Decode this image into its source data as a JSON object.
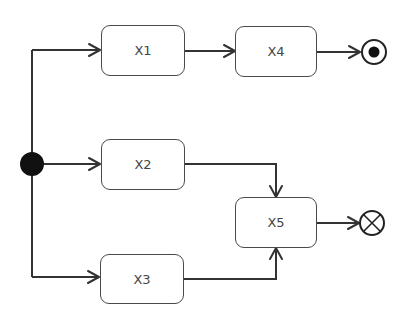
{
  "diagram": {
    "type": "UML activity diagram",
    "initial_node": {
      "id": "start",
      "shape": "filled-circle"
    },
    "final_node": {
      "id": "activity-final",
      "shape": "bullseye"
    },
    "flow_final_node": {
      "id": "flow-final",
      "shape": "circle-with-x"
    },
    "actions": [
      {
        "id": "X1",
        "label": "X1"
      },
      {
        "id": "X2",
        "label": "X2"
      },
      {
        "id": "X3",
        "label": "X3"
      },
      {
        "id": "X4",
        "label": "X4"
      },
      {
        "id": "X5",
        "label": "X5"
      }
    ],
    "edges": [
      {
        "from": "start",
        "to": "X1"
      },
      {
        "from": "start",
        "to": "X2"
      },
      {
        "from": "start",
        "to": "X3"
      },
      {
        "from": "X1",
        "to": "X4"
      },
      {
        "from": "X4",
        "to": "activity-final"
      },
      {
        "from": "X2",
        "to": "X5"
      },
      {
        "from": "X3",
        "to": "X5"
      },
      {
        "from": "X5",
        "to": "flow-final"
      }
    ],
    "colors": {
      "stroke": "#333333",
      "text": "#444444",
      "fill": "#ffffff"
    }
  }
}
